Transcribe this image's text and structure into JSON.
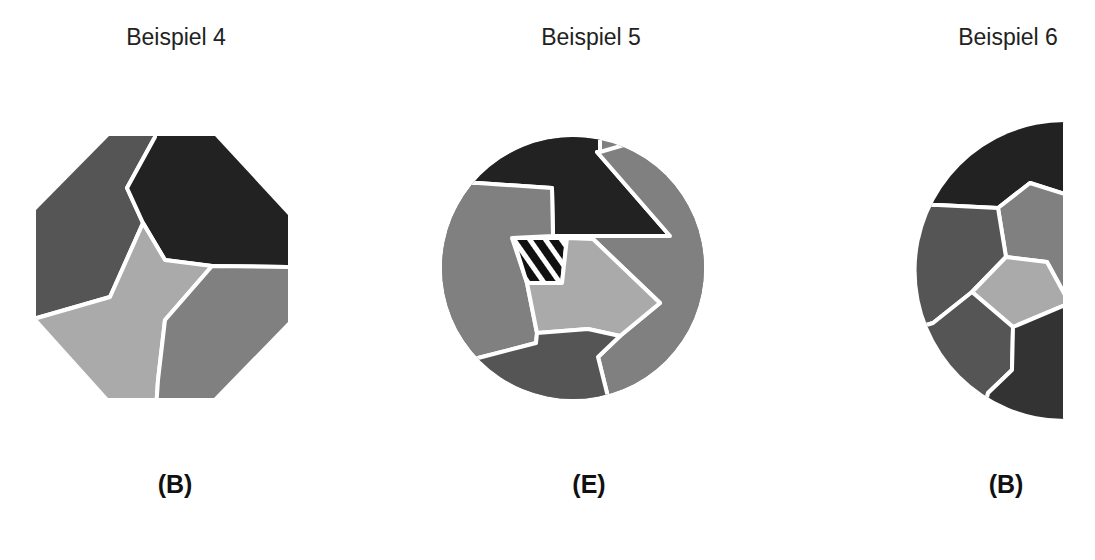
{
  "examples": [
    {
      "title": "Beispiel 4",
      "answer": "(B)",
      "shape": "octagon",
      "regions": [
        "dark-gray",
        "black",
        "light-gray",
        "medium-gray"
      ]
    },
    {
      "title": "Beispiel 5",
      "answer": "(E)",
      "shape": "circle",
      "regions": [
        "black",
        "medium-gray-left",
        "medium-gray-right",
        "hatched",
        "light-gray",
        "dark-gray-bottom"
      ]
    },
    {
      "title": "Beispiel 6",
      "answer": "(B)",
      "shape": "half-circle",
      "regions": [
        "black-top",
        "medium-gray",
        "dark-gray-left",
        "light-gray",
        "dark-gray-bottom-left",
        "black-bottom-right"
      ]
    }
  ],
  "colors": {
    "black": "#222222",
    "dark_gray": "#555555",
    "medium_gray": "#808080",
    "light_gray": "#aaaaaa",
    "divider": "#ffffff"
  }
}
